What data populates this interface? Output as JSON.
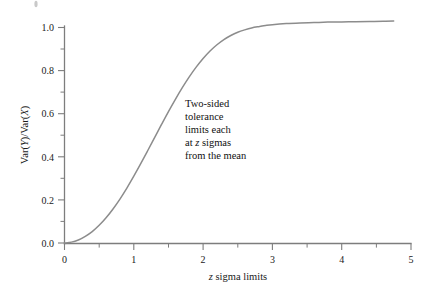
{
  "chart_data": {
    "type": "line",
    "title": "",
    "subtitle": "",
    "xlabel": "z sigma limits",
    "ylabel": "Var(Y)/Var(X)",
    "xlim": [
      0,
      5
    ],
    "ylim": [
      0.0,
      1.06
    ],
    "grid": false,
    "legend": null,
    "x_ticks": [
      "0",
      "1",
      "2",
      "3",
      "4",
      "5"
    ],
    "x_tick_values": [
      0,
      1,
      2,
      3,
      4,
      5
    ],
    "x_minor_tick_values": [
      0.5,
      1.5,
      2.5,
      3.5,
      4.5
    ],
    "y_ticks": [
      "0.0",
      "0.2",
      "0.4",
      "0.6",
      "0.8",
      "1.0"
    ],
    "y_tick_values": [
      0.0,
      0.2,
      0.4,
      0.6,
      0.8,
      1.0
    ],
    "y_minor_tick_values": [
      0.1,
      0.3,
      0.5,
      0.7,
      0.9
    ],
    "series": [
      {
        "name": "Var(Y)/Var(X)",
        "color": "#8c8c8c",
        "x": [
          0.0,
          0.1,
          0.2,
          0.3,
          0.4,
          0.5,
          0.6,
          0.7,
          0.8,
          0.9,
          1.0,
          1.1,
          1.2,
          1.3,
          1.4,
          1.5,
          1.6,
          1.7,
          1.8,
          1.9,
          2.0,
          2.1,
          2.2,
          2.3,
          2.4,
          2.5,
          2.6,
          2.7,
          2.8,
          2.9,
          3.0,
          3.2,
          3.4,
          3.6,
          3.8,
          4.0,
          4.2,
          4.4,
          4.6,
          4.75
        ],
        "y": [
          0.0,
          0.004,
          0.014,
          0.031,
          0.053,
          0.082,
          0.117,
          0.158,
          0.204,
          0.255,
          0.31,
          0.368,
          0.428,
          0.489,
          0.55,
          0.61,
          0.667,
          0.721,
          0.771,
          0.816,
          0.856,
          0.891,
          0.92,
          0.944,
          0.963,
          0.978,
          0.989,
          0.998,
          1.004,
          1.009,
          1.013,
          1.018,
          1.021,
          1.023,
          1.025,
          1.026,
          1.027,
          1.028,
          1.029,
          1.03
        ]
      }
    ],
    "annotations": [
      {
        "name": "curve-note",
        "x": 1.72,
        "y": 0.62,
        "lines": [
          {
            "pre": "Two-sided",
            "ital": "",
            "post": ""
          },
          {
            "pre": "tolerance",
            "ital": "",
            "post": ""
          },
          {
            "pre": "limits each",
            "ital": "",
            "post": ""
          },
          {
            "pre": "at ",
            "ital": "z",
            "post": " sigmas"
          },
          {
            "pre": "from the mean",
            "ital": "",
            "post": ""
          }
        ]
      }
    ]
  },
  "axis_titles": {
    "x": {
      "pre": "",
      "ital": "z",
      "post": " sigma limits"
    },
    "y": {
      "pre": "Var(",
      "ital1": "Y",
      "mid": ")/Var(",
      "ital2": "X",
      "post": ")"
    }
  },
  "colors": {
    "curve": "#8c8c8c",
    "axis": "#7d7d7d",
    "text": "#1a1a1a",
    "background": "#ffffff"
  }
}
